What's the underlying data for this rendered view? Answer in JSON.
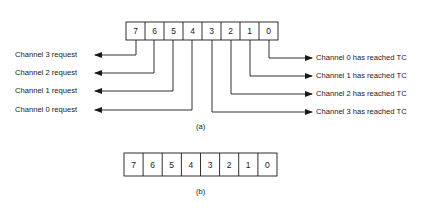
{
  "figure_a": {
    "bits": [
      "7",
      "6",
      "5",
      "4",
      "3",
      "2",
      "1",
      "0"
    ],
    "left_labels": [
      "Channel 3 request",
      "Channel 2 request",
      "Channel 1 request",
      "Channel 0 request"
    ],
    "right_labels": [
      "Channel 0 has reached TC",
      "Channel 1 has reached TC",
      "Channel 2 has reached TC",
      "Channel 3 has reached TC"
    ],
    "caption": "(a)"
  },
  "figure_b": {
    "bits": [
      "7",
      "6",
      "5",
      "4",
      "3",
      "2",
      "1",
      "0"
    ],
    "caption": "(b)"
  },
  "colors": {
    "line": "#1a1a1a",
    "background": "#ffffff"
  }
}
